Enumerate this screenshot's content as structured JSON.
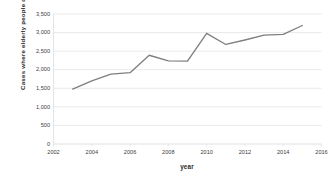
{
  "chart_data": {
    "type": "line",
    "title": "",
    "xlabel": "year",
    "ylabel": "Cases where elderly people died alone",
    "x": [
      2003,
      2004,
      2005,
      2006,
      2007,
      2008,
      2009,
      2010,
      2011,
      2012,
      2013,
      2014,
      2015
    ],
    "values": [
      1480,
      1700,
      1880,
      1920,
      2390,
      2240,
      2230,
      2980,
      2680,
      2800,
      2930,
      2950,
      3190
    ],
    "series": [
      {
        "name": "Cases where elderly people died alone",
        "values": [
          1480,
          1700,
          1880,
          1920,
          2390,
          2240,
          2230,
          2980,
          2680,
          2800,
          2930,
          2950,
          3190
        ]
      }
    ],
    "xlim": [
      2002,
      2016
    ],
    "ylim": [
      0,
      3500
    ],
    "x_ticks": [
      "2002",
      "2004",
      "2006",
      "2008",
      "2010",
      "2012",
      "2014",
      "2016"
    ],
    "x_tick_values": [
      2002,
      2004,
      2006,
      2008,
      2010,
      2012,
      2014,
      2016
    ],
    "y_ticks": [
      "0",
      "500",
      "1,000",
      "1,500",
      "2,000",
      "2,500",
      "3,000",
      "3,500"
    ],
    "y_tick_values": [
      0,
      500,
      1000,
      1500,
      2000,
      2500,
      3000,
      3500
    ],
    "grid": "horizontal",
    "legend": "none",
    "line_color": "#7f7f7f",
    "grid_color": "#d9d9d9",
    "background": "#ffffff",
    "text_color": "#404040"
  }
}
